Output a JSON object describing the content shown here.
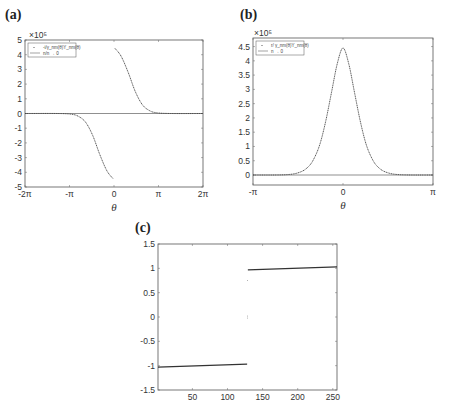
{
  "chart_data": [
    {
      "id": "a",
      "panel_label": "(a)",
      "type": "line",
      "title": "",
      "xlabel": "θ",
      "ylabel": "",
      "y_exponent": "×10⁵",
      "xlim": [
        -6.2832,
        6.2832
      ],
      "ylim": [
        -5,
        5
      ],
      "xticks": [
        "-2π",
        "-π",
        "0",
        "π",
        "2π"
      ],
      "yticks": [
        "5",
        "4",
        "3",
        "2",
        "1",
        "0",
        "-1",
        "-2",
        "-3",
        "-4",
        "-5"
      ],
      "legend": [
        "-i/γ_nm(θ)Y_nm(θ)",
        "n/n → 0"
      ],
      "legend_position": "upper left",
      "grid": false,
      "series": [
        {
          "name": "left branch",
          "x": [
            -6.28,
            -4.0,
            -3.0,
            -2.5,
            -2.0,
            -1.5,
            -1.0,
            -0.5,
            -0.05
          ],
          "y": [
            0,
            0,
            -0.05,
            -0.2,
            -0.6,
            -1.5,
            -2.8,
            -3.9,
            -4.45
          ]
        },
        {
          "name": "right branch",
          "x": [
            0.05,
            0.5,
            1.0,
            1.5,
            2.0,
            2.5,
            3.0,
            4.0,
            6.28
          ],
          "y": [
            4.45,
            3.9,
            2.8,
            1.5,
            0.6,
            0.2,
            0.05,
            0,
            0
          ]
        }
      ]
    },
    {
      "id": "b",
      "panel_label": "(b)",
      "type": "line",
      "title": "",
      "xlabel": "θ",
      "ylabel": "",
      "y_exponent": "×10⁵",
      "xlim": [
        -3.1416,
        3.1416
      ],
      "ylim": [
        -0.35,
        4.8
      ],
      "xticks": [
        "-π",
        "0",
        "π"
      ],
      "yticks": [
        "4.5",
        "4",
        "3.5",
        "3",
        "2.5",
        "2",
        "1.5",
        "1",
        "0.5",
        "0"
      ],
      "legend": [
        "r/ γ_nm(θ)Y_nm(θ)",
        "n → 0"
      ],
      "legend_position": "upper left",
      "grid": false,
      "series": [
        {
          "name": "peak",
          "x": [
            -3.14,
            -2.0,
            -1.5,
            -1.2,
            -1.0,
            -0.8,
            -0.6,
            -0.4,
            -0.2,
            0,
            0.2,
            0.4,
            0.6,
            0.8,
            1.0,
            1.2,
            1.5,
            2.0,
            3.14
          ],
          "y": [
            0,
            0.01,
            0.1,
            0.3,
            0.6,
            1.1,
            1.9,
            2.9,
            3.9,
            4.45,
            3.9,
            2.9,
            1.9,
            1.1,
            0.6,
            0.3,
            0.1,
            0.01,
            0
          ]
        }
      ]
    },
    {
      "id": "c",
      "panel_label": "(c)",
      "type": "line",
      "title": "",
      "xlabel": "",
      "ylabel": "",
      "xlim": [
        1,
        256
      ],
      "ylim": [
        -1.5,
        1.5
      ],
      "xticks": [
        "50",
        "100",
        "150",
        "200",
        "250"
      ],
      "yticks": [
        "1.5",
        "1",
        "0.5",
        "0",
        "-0.5",
        "-1",
        "-1.5"
      ],
      "grid": false,
      "series": [
        {
          "name": "lower segment",
          "x": [
            1,
            128
          ],
          "y": [
            -1.03,
            -0.97
          ]
        },
        {
          "name": "upper segment",
          "x": [
            129,
            256
          ],
          "y": [
            0.97,
            1.03
          ]
        },
        {
          "name": "transition points",
          "x": [
            128.5,
            128.5,
            128.5
          ],
          "y": [
            0.75,
            0.02,
            -0.02
          ]
        }
      ]
    }
  ]
}
